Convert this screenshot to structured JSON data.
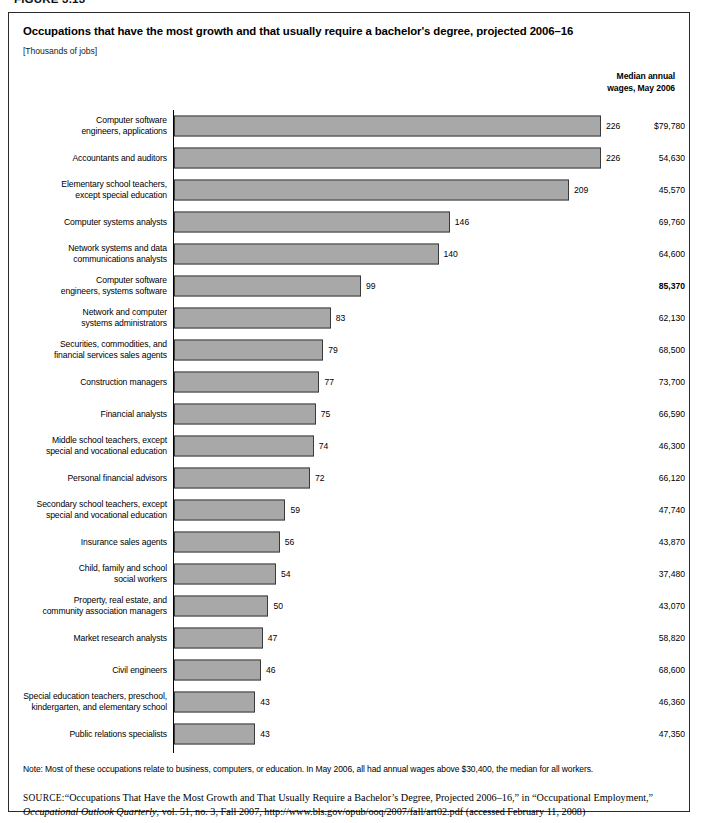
{
  "figure": {
    "label": "FIGURE 3.13"
  },
  "header": {
    "title": "Occupations that have the most growth and that usually require a bachelor's degree, projected 2006–16",
    "units": "[Thousands of jobs]",
    "wage_column_line1": "Median annual",
    "wage_column_line2": "wages, May 2006"
  },
  "footer": {
    "note": "Note: Most of these occupations relate to business, computers, or education. In May 2006, all had annual wages above $30,400, the median for all workers.",
    "source_label": "SOURCE:",
    "source_line1": "“Occupations That Have the Most Growth and That Usually Require a Bachelor’s Degree, Projected 2006–16,” in “Occupational Employment,”",
    "source_italic": "Occupational Outlook Quarterly",
    "source_line2": ", vol. 51, no. 3, Fall 2007, http://www.bls.gov/opub/ooq/2007/fall/art02.pdf (accessed February 11, 2008)"
  },
  "chart_data": {
    "type": "bar",
    "orientation": "horizontal",
    "title": "Occupations that have the most growth and that usually require a bachelor's degree, projected 2006–16",
    "xlabel": "Thousands of jobs",
    "ylabel": "",
    "xlim": [
      0,
      230
    ],
    "grid": false,
    "legend": null,
    "bar_color": "#a8a8a8",
    "bar_border_color": "#3a3a3a",
    "categories": [
      "Computer software engineers, applications",
      "Accountants and auditors",
      "Elementary school teachers, except special education",
      "Computer systems analysts",
      "Network systems and data communications analysts",
      "Computer software engineers, systems software",
      "Network and computer systems administrators",
      "Securities, commodities, and financial services sales agents",
      "Construction managers",
      "Financial analysts",
      "Middle school teachers, except special and vocational education",
      "Personal financial advisors",
      "Secondary school teachers, except special and vocational education",
      "Insurance sales agents",
      "Child, family and school social workers",
      "Property, real estate, and community association managers",
      "Market research analysts",
      "Civil engineers",
      "Special education teachers, preschool, kindergarten, and elementary school",
      "Public relations specialists"
    ],
    "values": [
      226,
      226,
      209,
      146,
      140,
      99,
      83,
      79,
      77,
      75,
      74,
      72,
      59,
      56,
      54,
      50,
      47,
      46,
      43,
      43
    ],
    "wages": [
      "$79,780",
      "54,630",
      "45,570",
      "69,760",
      "64,600",
      "85,370",
      "62,130",
      "68,500",
      "73,700",
      "66,590",
      "46,300",
      "66,120",
      "47,740",
      "43,870",
      "37,480",
      "43,070",
      "58,820",
      "68,600",
      "46,360",
      "47,350"
    ],
    "wages_bold": [
      false,
      false,
      false,
      false,
      false,
      true,
      false,
      false,
      false,
      false,
      false,
      false,
      false,
      false,
      false,
      false,
      false,
      false,
      false,
      false
    ]
  },
  "rows": [
    {
      "label_lines": [
        "Computer software",
        "engineers, applications"
      ],
      "value": "226",
      "wage": "$79,780",
      "bold": false
    },
    {
      "label_lines": [
        "Accountants and auditors"
      ],
      "value": "226",
      "wage": "54,630",
      "bold": false
    },
    {
      "label_lines": [
        "Elementary school teachers,",
        "except special education"
      ],
      "value": "209",
      "wage": "45,570",
      "bold": false
    },
    {
      "label_lines": [
        "Computer systems analysts"
      ],
      "value": "146",
      "wage": "69,760",
      "bold": false
    },
    {
      "label_lines": [
        "Network systems and data",
        "communications analysts"
      ],
      "value": "140",
      "wage": "64,600",
      "bold": false
    },
    {
      "label_lines": [
        "Computer software",
        "engineers, systems software"
      ],
      "value": "99",
      "wage": "85,370",
      "bold": true
    },
    {
      "label_lines": [
        "Network and computer",
        "systems administrators"
      ],
      "value": "83",
      "wage": "62,130",
      "bold": false
    },
    {
      "label_lines": [
        "Securities, commodities, and",
        "financial services sales agents"
      ],
      "value": "79",
      "wage": "68,500",
      "bold": false
    },
    {
      "label_lines": [
        "Construction managers"
      ],
      "value": "77",
      "wage": "73,700",
      "bold": false
    },
    {
      "label_lines": [
        "Financial analysts"
      ],
      "value": "75",
      "wage": "66,590",
      "bold": false
    },
    {
      "label_lines": [
        "Middle school teachers, except",
        "special and vocational education"
      ],
      "value": "74",
      "wage": "46,300",
      "bold": false
    },
    {
      "label_lines": [
        "Personal financial advisors"
      ],
      "value": "72",
      "wage": "66,120",
      "bold": false
    },
    {
      "label_lines": [
        "Secondary school teachers, except",
        "special and vocational education"
      ],
      "value": "59",
      "wage": "47,740",
      "bold": false
    },
    {
      "label_lines": [
        "Insurance sales agents"
      ],
      "value": "56",
      "wage": "43,870",
      "bold": false
    },
    {
      "label_lines": [
        "Child, family and school",
        "social workers"
      ],
      "value": "54",
      "wage": "37,480",
      "bold": false
    },
    {
      "label_lines": [
        "Property, real estate, and",
        "community association managers"
      ],
      "value": "50",
      "wage": "43,070",
      "bold": false
    },
    {
      "label_lines": [
        "Market research analysts"
      ],
      "value": "47",
      "wage": "58,820",
      "bold": false
    },
    {
      "label_lines": [
        "Civil engineers"
      ],
      "value": "46",
      "wage": "68,600",
      "bold": false
    },
    {
      "label_lines": [
        "Special education teachers, preschool,",
        "kindergarten, and elementary school"
      ],
      "value": "43",
      "wage": "46,360",
      "bold": false
    },
    {
      "label_lines": [
        "Public relations specialists"
      ],
      "value": "43",
      "wage": "47,350",
      "bold": false
    }
  ]
}
